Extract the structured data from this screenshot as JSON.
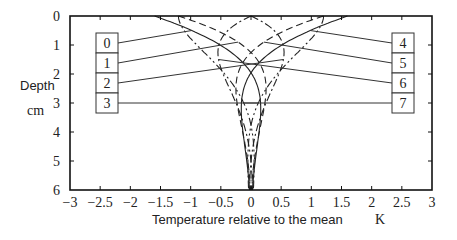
{
  "chart_data": {
    "type": "line",
    "title": "",
    "xlabel": "Temperature relative to the mean",
    "xunit": "K",
    "ylabel": "Depth",
    "yunit": "cm",
    "xlim": [
      -3,
      3
    ],
    "ylim": [
      0,
      6
    ],
    "y_inverted": true,
    "grid": false,
    "x_ticks": [
      "-3",
      "-2.5",
      "-2",
      "-1.5",
      "-1",
      "-0.5",
      "0",
      "0.5",
      "1",
      "1.5",
      "2",
      "2.5",
      "3"
    ],
    "y_ticks": [
      "0",
      "1",
      "2",
      "3",
      "4",
      "5",
      "6"
    ],
    "model": {
      "description": "Damped soil temperature wave T(z) = A * exp(-z/d) * sin(phase - z/d)",
      "amplitude_K": 1.7,
      "damping_depth_cm": 1.6
    },
    "series": [
      {
        "name": "0",
        "phase_deg": 250,
        "style": "solid",
        "surface_value": -1.6
      },
      {
        "name": "1",
        "phase_deg": 225,
        "style": "dashed",
        "surface_value": -1.2
      },
      {
        "name": "2",
        "phase_deg": 180,
        "style": "dashdot",
        "surface_value": 0.0
      },
      {
        "name": "3",
        "phase_deg": 135,
        "style": "dashdotdot",
        "surface_value": 1.2
      },
      {
        "name": "4",
        "phase_deg": 70,
        "style": "solid",
        "surface_value": 1.6
      },
      {
        "name": "5",
        "phase_deg": 45,
        "style": "dashed",
        "surface_value": 1.2
      },
      {
        "name": "6",
        "phase_deg": 0,
        "style": "dashdot",
        "surface_value": 0.0
      },
      {
        "name": "7",
        "phase_deg": 315,
        "style": "dashdotdot",
        "surface_value": -1.2
      }
    ],
    "legend_left": [
      "0",
      "1",
      "2",
      "3"
    ],
    "legend_right": [
      "4",
      "5",
      "6",
      "7"
    ]
  }
}
